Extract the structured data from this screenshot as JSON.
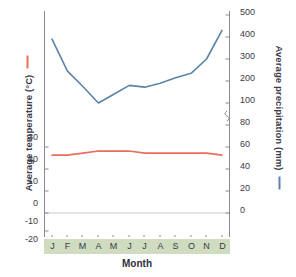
{
  "chart_data": {
    "type": "line",
    "title": "",
    "xlabel": "Month",
    "categories": [
      "J",
      "F",
      "M",
      "A",
      "M",
      "J",
      "J",
      "A",
      "S",
      "O",
      "N",
      "D"
    ],
    "month_names": [
      "January",
      "February",
      "March",
      "April",
      "May",
      "June",
      "July",
      "August",
      "September",
      "October",
      "November",
      "December"
    ],
    "grid": false,
    "legend_position": "axis-titles",
    "series": [
      {
        "name": "Average temperature (°C)",
        "axis": "left",
        "unit": "°C",
        "color": "#e8705a",
        "values": [
          26,
          26,
          27,
          28,
          28,
          28,
          27,
          27,
          27,
          27,
          27,
          26
        ],
        "ylabel": "Average temperature (°C)",
        "ylim": [
          -20,
          45
        ],
        "yticks": [
          30,
          20,
          10,
          0,
          -10,
          -20
        ],
        "ytick_labels": [
          "30",
          "20",
          "10",
          "0",
          "-10",
          "-20"
        ]
      },
      {
        "name": "Average precipitation (mm)",
        "axis": "right",
        "unit": "mm",
        "color": "#5b84a8",
        "values": [
          390,
          245,
          175,
          100,
          140,
          180,
          172,
          190,
          215,
          235,
          300,
          430
        ],
        "ylabel": "Average precipitation (mm)",
        "ylim": [
          0,
          500
        ],
        "axis_break": true,
        "axis_break_between": [
          80,
          100
        ],
        "yticks": [
          500,
          400,
          300,
          200,
          100,
          80,
          60,
          40,
          20,
          0
        ],
        "ytick_labels": [
          "500",
          "400",
          "300",
          "200",
          "100",
          "80",
          "60",
          "40",
          "20",
          "0"
        ]
      }
    ]
  },
  "axes": {
    "left": {
      "title": "Average temperature (°C)",
      "legend_dash": "red-line-swatch",
      "ticks": [
        "30",
        "20",
        "10",
        "0",
        "-10",
        "-20"
      ]
    },
    "right": {
      "title": "Average precipitation (mm)",
      "legend_dash": "blue-line-swatch",
      "ticks": [
        "500",
        "400",
        "300",
        "200",
        "100",
        "80",
        "60",
        "40",
        "20",
        "0"
      ]
    },
    "x": {
      "title": "Month",
      "ticks": [
        "J",
        "F",
        "M",
        "A",
        "M",
        "J",
        "J",
        "A",
        "S",
        "O",
        "N",
        "D"
      ]
    }
  },
  "colors": {
    "temperature_line": "#e8705a",
    "precipitation_line": "#5b84a8",
    "month_band": "#cfdcc0",
    "axis": "#8a8a96",
    "zero_line": "#c2ccd8",
    "text": "#3a3a48"
  }
}
